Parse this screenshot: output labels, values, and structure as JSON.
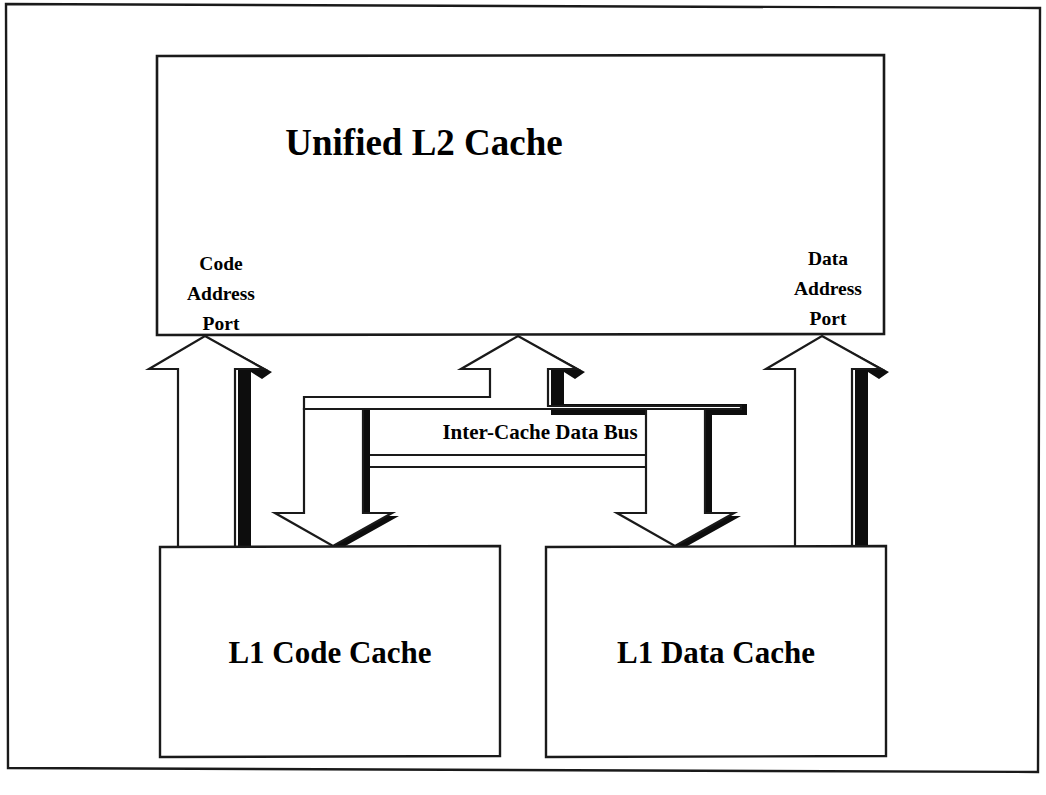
{
  "diagram": {
    "type": "block-diagram",
    "l2": {
      "title": "Unified L2 Cache",
      "ports": [
        {
          "id": "code-address-port",
          "lines": [
            "Code",
            "Address",
            "Port"
          ]
        },
        {
          "id": "data-address-port",
          "lines": [
            "Data",
            "Address",
            "Port"
          ]
        }
      ]
    },
    "bus": {
      "label": "Inter-Cache Data Bus"
    },
    "l1": [
      {
        "id": "l1-code-cache",
        "title": "L1 Code Cache"
      },
      {
        "id": "l1-data-cache",
        "title": "L1 Data Cache"
      }
    ],
    "connections": [
      {
        "name": "code-address-arrow",
        "from": "l1-code-cache",
        "to": "code-address-port",
        "direction": "up"
      },
      {
        "name": "data-address-arrow",
        "from": "l1-data-cache",
        "to": "data-address-port",
        "direction": "up"
      },
      {
        "name": "bus-to-l2-arrow",
        "from": "inter-cache-data-bus",
        "to": "unified-l2-cache",
        "direction": "up"
      },
      {
        "name": "bus-to-l1-code-arrow",
        "from": "inter-cache-data-bus",
        "to": "l1-code-cache",
        "direction": "down"
      },
      {
        "name": "bus-to-l1-data-arrow",
        "from": "inter-cache-data-bus",
        "to": "l1-data-cache",
        "direction": "down"
      }
    ],
    "colors": {
      "ink": "#1a1a1a",
      "shadow": "#0d0d0d",
      "paper": "#ffffff"
    }
  }
}
